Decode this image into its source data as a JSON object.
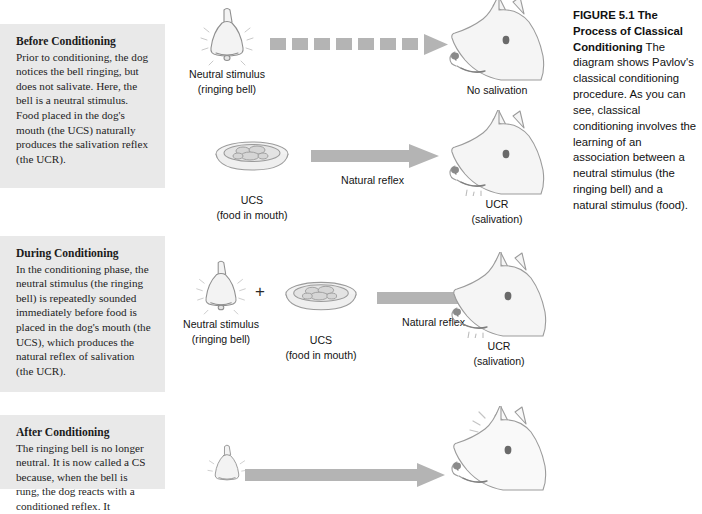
{
  "figure": {
    "caption_bold": "FIGURE 5.1 The Process of Classical Conditioning",
    "caption_text": " The diagram shows Pavlov's classical conditioning procedure. As you can see, classical conditioning involves the learning of an association between a neutral stimulus (the ringing bell) and a natural stimulus (food)."
  },
  "panels": [
    {
      "id": "before",
      "title": "Before Conditioning",
      "body": "Prior to conditioning, the dog notices the bell ringing, but does not salivate. Here, the bell is a neutral stimulus. Food placed in the dog's mouth (the UCS) naturally produces the salivation reflex (the UCR)."
    },
    {
      "id": "during",
      "title": "During Conditioning",
      "body": "In the conditioning phase, the neutral stimulus (the ringing bell) is repeatedly sounded immediately before food is placed in the dog's mouth (the UCS), which produces the natural reflex of salivation (the UCR)."
    },
    {
      "id": "after",
      "title": "After Conditioning",
      "body": "The ringing bell is no longer neutral. It is now called a CS because, when the bell is rung, the dog reacts with a conditioned reflex. It"
    }
  ],
  "rows": {
    "row1": {
      "stimulus_label_line1": "Neutral stimulus",
      "stimulus_label_line2": "(ringing bell)",
      "response_label": "No salivation",
      "arrow_type": "dashed"
    },
    "row2": {
      "stimulus_label_line1": "UCS",
      "stimulus_label_line2": "(food in mouth)",
      "arrow_label": "Natural reflex",
      "response_label_line1": "UCR",
      "response_label_line2": "(salivation)",
      "arrow_type": "solid"
    },
    "row3": {
      "stimulus_label_line1": "Neutral stimulus",
      "stimulus_label_line2": "(ringing bell)",
      "plus_sign": "+",
      "ucs_label_line1": "UCS",
      "ucs_label_line2": "(food in mouth)",
      "arrow_label": "Natural reflex",
      "response_label_line1": "UCR",
      "response_label_line2": "(salivation)",
      "arrow_type": "solid"
    },
    "row4": {
      "arrow_type": "solid"
    }
  },
  "colors": {
    "panel_background": "#e9e9e9",
    "arrow_gray": "#b4b4b4",
    "text_dark": "#141414"
  }
}
